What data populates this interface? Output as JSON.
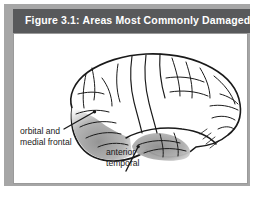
{
  "figure": {
    "title": "Figure 3.1:  Areas Most Commonly Damaged",
    "title_bar_color": "#58595b",
    "title_text_color": "#ffffff",
    "panel_background": "#ffffff",
    "panel_border_color": "#9a9a9a",
    "shadow_color": "#a6a6a6"
  },
  "illustration": {
    "subject": "lateral view of human brain",
    "outline_color": "#1a1a1a",
    "shaded_region_color": "#9c9c9c",
    "regions": [
      {
        "name": "orbital-and-medial-frontal",
        "label_line_1": "orbital and",
        "label_line_2": "medial frontal"
      },
      {
        "name": "anterior-temporal",
        "label_line_1": "anterior",
        "label_line_2": "temporal"
      }
    ]
  },
  "labels": {
    "orbital": {
      "line1": "orbital and",
      "line2": "medial frontal"
    },
    "anterior": {
      "line1": "anterior",
      "line2": "temporal"
    }
  }
}
